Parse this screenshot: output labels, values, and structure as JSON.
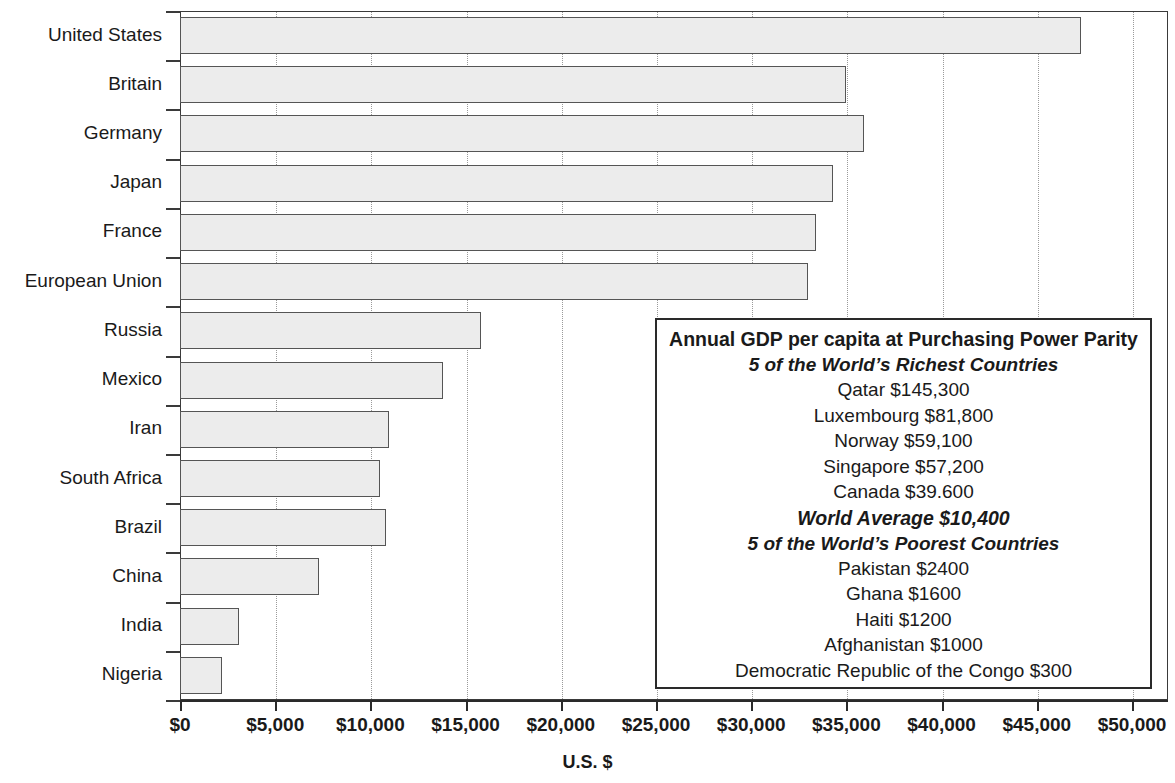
{
  "chart_data": {
    "type": "bar",
    "orientation": "horizontal",
    "title": "Annual GDP per capita at Purchasing Power Parity",
    "xlabel": "U.S. $",
    "ylabel": "",
    "xlim": [
      0,
      50000
    ],
    "xticks": [
      0,
      5000,
      10000,
      15000,
      20000,
      25000,
      30000,
      35000,
      40000,
      45000,
      50000
    ],
    "xtick_labels": [
      "$0",
      "$5,000",
      "$10,000",
      "$15,000",
      "$20,000",
      "$25,000",
      "$30,000",
      "$35,000",
      "$40,000",
      "$45,000",
      "$50,000"
    ],
    "grid": true,
    "grid_axis": "x",
    "legend": "none",
    "categories": [
      "United States",
      "Britain",
      "Germany",
      "Japan",
      "France",
      "European Union",
      "Russia",
      "Mexico",
      "Iran",
      "South Africa",
      "Brazil",
      "China",
      "India",
      "Nigeria"
    ],
    "values": [
      47300,
      35000,
      35900,
      34300,
      33400,
      33000,
      15800,
      13800,
      11000,
      10500,
      10800,
      7300,
      3100,
      2200
    ],
    "bar_fill": "#ececec",
    "bar_edge": "#555555"
  },
  "axis": {
    "x_title": "U.S. $",
    "tick_labels": [
      "$0",
      "$5,000",
      "$10,000",
      "$15,000",
      "$20,000",
      "$25,000",
      "$30,000",
      "$35,000",
      "$40,000",
      "$45,000",
      "$50,000"
    ],
    "country_labels": [
      "United States",
      "Britain",
      "Germany",
      "Japan",
      "France",
      "European Union",
      "Russia",
      "Mexico",
      "Iran",
      "South Africa",
      "Brazil",
      "China",
      "India",
      "Nigeria"
    ]
  },
  "legend_box": {
    "title": "Annual GDP per capita at Purchasing Power Parity",
    "richest_heading": "5 of the World’s Richest Countries",
    "richest": [
      "Qatar $145,300",
      "Luxembourg $81,800",
      "Norway $59,100",
      "Singapore $57,200",
      "Canada $39.600"
    ],
    "world_average": "World Average $10,400",
    "poorest_heading": "5 of the World’s Poorest Countries",
    "poorest": [
      "Pakistan $2400",
      "Ghana $1600",
      "Haiti $1200",
      "Afghanistan $1000",
      "Democratic Republic of the Congo $300"
    ]
  },
  "colors": {
    "bar_fill": "#ececec",
    "bar_edge": "#555555",
    "axis": "#2a2a2a",
    "grid": "#9a9a9a",
    "text": "#1a1a1a"
  }
}
